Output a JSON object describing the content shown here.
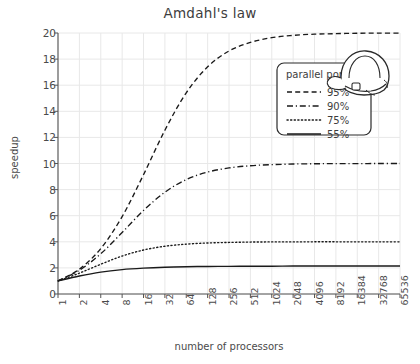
{
  "figure": {
    "title": "Amdahl's law",
    "background_color": "#ffffff",
    "ink_color": "#333333",
    "grid_color": "#e8e8e8",
    "axis_color": "#555555",
    "bottom_caption": ""
  },
  "annotations": {
    "doodle": {
      "name": "hard-hat-doodle",
      "description": "hand-drawn safety helmet overlapping the legend top-right corner"
    }
  },
  "legend": {
    "title": "parallel portion",
    "box": {
      "x": 277,
      "y": 63,
      "width": 94,
      "height": 72
    },
    "entries": [
      {
        "label": "95%",
        "style": "dashed"
      },
      {
        "label": "90%",
        "style": "dashdot"
      },
      {
        "label": "75%",
        "style": "dotted"
      },
      {
        "label": "55%",
        "style": "solid"
      }
    ]
  },
  "chart_data": {
    "type": "line",
    "title": "Amdahl's law",
    "xlabel": "number of processors",
    "ylabel": "speedup",
    "xscale": "log2",
    "grid": true,
    "legend_position": "upper right",
    "legend_title": "parallel portion",
    "xlim": [
      1,
      65536
    ],
    "ylim": [
      0,
      20
    ],
    "xticklabels": [
      "1",
      "2",
      "4",
      "8",
      "16",
      "32",
      "64",
      "128",
      "256",
      "512",
      "1024",
      "2048",
      "4096",
      "8192",
      "16384",
      "32768",
      "65536"
    ],
    "x": [
      1,
      2,
      4,
      8,
      16,
      32,
      64,
      128,
      256,
      512,
      1024,
      2048,
      4096,
      8192,
      16384,
      32768,
      65536
    ],
    "yticklabels": [
      "0",
      "2",
      "4",
      "6",
      "8",
      "10",
      "12",
      "14",
      "16",
      "18",
      "20"
    ],
    "yticks": [
      0,
      2,
      4,
      6,
      8,
      10,
      12,
      14,
      16,
      18,
      20
    ],
    "series": [
      {
        "name": "95%",
        "style": "dashed",
        "color": "#1a1a1a",
        "asymptote": 20,
        "values": [
          1.0,
          1.9,
          3.48,
          5.93,
          9.14,
          12.55,
          15.42,
          17.41,
          18.62,
          19.28,
          19.64,
          19.82,
          19.91,
          19.95,
          19.98,
          19.99,
          19.99
        ]
      },
      {
        "name": "90%",
        "style": "dashdot",
        "color": "#1a1a1a",
        "asymptote": 10,
        "values": [
          1.0,
          1.82,
          3.08,
          4.71,
          6.4,
          7.8,
          8.77,
          9.34,
          9.66,
          9.83,
          9.91,
          9.96,
          9.98,
          9.99,
          9.99,
          10.0,
          10.0
        ]
      },
      {
        "name": "75%",
        "style": "dotted",
        "color": "#1a1a1a",
        "asymptote": 4,
        "values": [
          1.0,
          1.6,
          2.28,
          2.91,
          3.37,
          3.66,
          3.82,
          3.91,
          3.95,
          3.98,
          3.99,
          3.99,
          4.0,
          4.0,
          4.0,
          4.0,
          4.0
        ]
      },
      {
        "name": "55%",
        "style": "solid",
        "color": "#1a1a1a",
        "asymptote": 2.22,
        "values": [
          1.0,
          1.38,
          1.68,
          1.87,
          1.98,
          2.05,
          2.09,
          2.11,
          2.12,
          2.13,
          2.13,
          2.14,
          2.14,
          2.14,
          2.14,
          2.14,
          2.14
        ]
      }
    ]
  }
}
